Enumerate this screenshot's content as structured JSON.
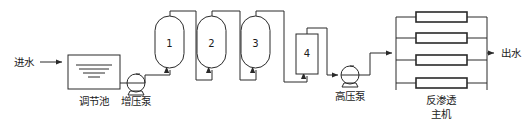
{
  "diagram": {
    "type": "process-flow",
    "line_color": "#2a2a2a",
    "background_color": "#ffffff",
    "inlet": {
      "label": "进水",
      "arrow": "right-arrow-icon"
    },
    "outlet": {
      "label": "出水",
      "arrow": "right-arrow-icon"
    },
    "equipment": [
      {
        "id": "regulating-basin",
        "label": "调节池",
        "shape": "rectangle-with-water-lines",
        "water_lines": 3
      },
      {
        "id": "booster-pump",
        "label": "增压泵",
        "shape": "pump-circle"
      },
      {
        "id": "vessel-1",
        "label": "1",
        "shape": "capsule"
      },
      {
        "id": "vessel-2",
        "label": "2",
        "shape": "capsule"
      },
      {
        "id": "vessel-3",
        "label": "3",
        "shape": "capsule"
      },
      {
        "id": "vessel-4",
        "label": "4",
        "shape": "rectangle"
      },
      {
        "id": "high-pressure-pump",
        "label": "高压泵",
        "shape": "pump-circle"
      },
      {
        "id": "ro-main-unit",
        "label_line1": "反渗透",
        "label_line2": "主机",
        "shape": "membrane-rack",
        "module_count": 4
      }
    ]
  }
}
